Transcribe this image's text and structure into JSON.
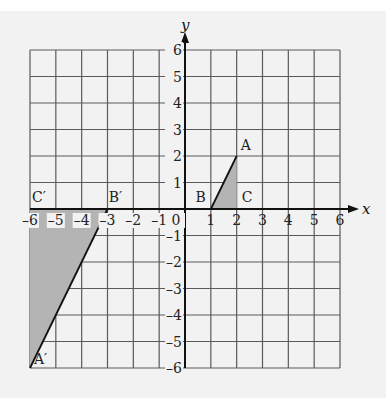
{
  "diagram": {
    "type": "coordinate-grid-transformation",
    "axes": {
      "x_label": "x",
      "y_label": "y",
      "x_range": [
        -6,
        6
      ],
      "y_range": [
        -6,
        6
      ],
      "x_ticks": [
        "-6",
        "-5",
        "-4",
        "-3",
        "-2",
        "-1",
        "0",
        "1",
        "2",
        "3",
        "4",
        "5",
        "6"
      ],
      "y_ticks": [
        "6",
        "5",
        "4",
        "3",
        "2",
        "1",
        "-1",
        "-2",
        "-3",
        "-4",
        "-5",
        "-6"
      ]
    },
    "shapes": [
      {
        "name": "triangle-ABC",
        "vertices": [
          {
            "label": "A",
            "x": 2,
            "y": 2
          },
          {
            "label": "B",
            "x": 1,
            "y": 0
          },
          {
            "label": "C",
            "x": 2,
            "y": 0
          }
        ]
      },
      {
        "name": "triangle-A'B'C'",
        "vertices": [
          {
            "label": "A′",
            "x": -6,
            "y": -6
          },
          {
            "label": "B′",
            "x": -3,
            "y": 0
          },
          {
            "label": "C′",
            "x": -6,
            "y": 0
          }
        ]
      }
    ],
    "colors": {
      "background": "#f2f2f2",
      "grid": "#5a5a5a",
      "axis": "#111111",
      "shape_fill": "#b4b4b4"
    }
  }
}
